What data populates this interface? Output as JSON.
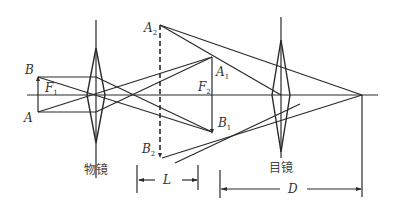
{
  "diagram": {
    "labels": {
      "B": "B",
      "A": "A",
      "F1": "F",
      "F1_sub": "1",
      "A2": "A",
      "A2_sub": "2",
      "A1": "A",
      "A1_sub": "1",
      "F2": "F",
      "F2_sub": "2",
      "B1": "B",
      "B1_sub": "1",
      "B2": "B",
      "B2_sub": "2",
      "L": "L",
      "D": "D",
      "objective": "物镜",
      "eyepiece": "目镜"
    },
    "colors": {
      "line": "#2a2a2a",
      "text": "#333333",
      "background": "#ffffff"
    }
  }
}
